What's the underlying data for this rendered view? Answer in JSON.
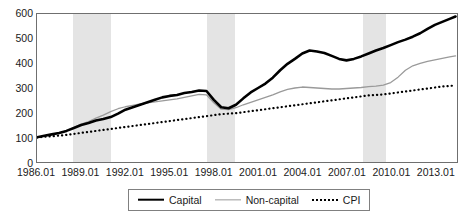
{
  "chart_data": {
    "type": "line",
    "title": "",
    "xlabel": "",
    "ylabel": "",
    "xlim": [
      1986.0,
      2014.5
    ],
    "ylim": [
      0,
      600
    ],
    "grid": false,
    "legend_position": "bottom-center",
    "y_ticks": [
      600,
      500,
      400,
      300,
      200,
      100,
      0
    ],
    "x_ticks": [
      "1986.01",
      "1989.01",
      "1992.01",
      "1995.01",
      "1998.01",
      "2001.01",
      "2004.01",
      "2007.01",
      "2010.01",
      "2013.01"
    ],
    "x_tick_values": [
      1986.0,
      1989.0,
      1992.0,
      1995.0,
      1998.0,
      2001.0,
      2004.0,
      2007.0,
      2010.0,
      2013.0
    ],
    "shaded_bands": [
      {
        "name": "recession-band-1",
        "start": 1988.4,
        "end": 1991.0
      },
      {
        "name": "recession-band-2",
        "start": 1997.5,
        "end": 1999.4
      },
      {
        "name": "recession-band-3",
        "start": 2008.0,
        "end": 2009.6
      }
    ],
    "x": [
      1986.0,
      1986.5,
      1987.0,
      1987.5,
      1988.0,
      1988.5,
      1989.0,
      1989.5,
      1990.0,
      1990.5,
      1991.0,
      1991.5,
      1992.0,
      1992.5,
      1993.0,
      1993.5,
      1994.0,
      1994.5,
      1995.0,
      1995.5,
      1996.0,
      1996.5,
      1997.0,
      1997.5,
      1998.0,
      1998.5,
      1999.0,
      1999.5,
      2000.0,
      2000.5,
      2001.0,
      2001.5,
      2002.0,
      2002.5,
      2003.0,
      2003.5,
      2004.0,
      2004.5,
      2005.0,
      2005.5,
      2006.0,
      2006.5,
      2007.0,
      2007.5,
      2008.0,
      2008.5,
      2009.0,
      2009.5,
      2010.0,
      2010.5,
      2011.0,
      2011.5,
      2012.0,
      2012.5,
      2013.0,
      2013.5,
      2014.0,
      2014.4
    ],
    "series": [
      {
        "name": "Capital",
        "color": "#000000",
        "style": "solid-thick",
        "values": [
          100,
          106,
          112,
          118,
          126,
          138,
          150,
          158,
          168,
          174,
          182,
          196,
          212,
          222,
          232,
          242,
          252,
          262,
          268,
          272,
          280,
          284,
          290,
          288,
          252,
          222,
          218,
          232,
          258,
          282,
          300,
          318,
          342,
          372,
          398,
          418,
          440,
          452,
          448,
          442,
          430,
          418,
          412,
          418,
          428,
          440,
          452,
          462,
          474,
          486,
          496,
          508,
          522,
          540,
          556,
          568,
          580,
          590
        ]
      },
      {
        "name": "Non-capital",
        "color": "#9a9a9a",
        "style": "solid-thin",
        "values": [
          100,
          106,
          112,
          118,
          126,
          140,
          154,
          164,
          178,
          190,
          204,
          216,
          224,
          230,
          236,
          240,
          244,
          248,
          252,
          256,
          262,
          268,
          274,
          272,
          240,
          214,
          212,
          220,
          232,
          242,
          252,
          262,
          272,
          284,
          294,
          300,
          304,
          302,
          300,
          298,
          296,
          296,
          298,
          300,
          302,
          306,
          308,
          312,
          322,
          344,
          372,
          390,
          400,
          408,
          414,
          420,
          426,
          430
        ]
      },
      {
        "name": "CPI",
        "color": "#000000",
        "style": "dotted",
        "values": [
          100,
          102,
          104,
          107,
          110,
          114,
          118,
          122,
          126,
          130,
          134,
          138,
          142,
          146,
          150,
          154,
          158,
          162,
          166,
          170,
          174,
          178,
          182,
          186,
          190,
          194,
          196,
          198,
          202,
          206,
          210,
          214,
          218,
          222,
          226,
          230,
          234,
          238,
          242,
          246,
          250,
          254,
          258,
          262,
          266,
          270,
          272,
          274,
          278,
          282,
          286,
          290,
          294,
          298,
          302,
          306,
          308,
          311
        ]
      }
    ]
  },
  "legend": {
    "items": [
      {
        "label": "Capital",
        "swatch": "solid-thick-black-line"
      },
      {
        "label": "Non-capital",
        "swatch": "solid-thin-gray-line"
      },
      {
        "label": "CPI",
        "swatch": "dotted-black-line"
      }
    ]
  },
  "colors": {
    "capital": "#000000",
    "non_capital": "#9a9a9a",
    "cpi": "#000000",
    "shade_band": "#e4e4e4",
    "axis": "#6f6f6f",
    "text": "#1a1a1a"
  }
}
